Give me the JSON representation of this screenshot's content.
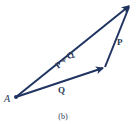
{
  "figure": {
    "caption": "(b)",
    "point_label": "A",
    "vectors": {
      "sum": {
        "label": "P + Q"
      },
      "q": {
        "label": "Q"
      },
      "p": {
        "label": "P"
      }
    },
    "colors": {
      "vector": "#1f3460",
      "text": "#2a3a58"
    }
  }
}
